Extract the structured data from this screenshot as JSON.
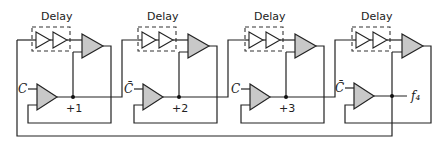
{
  "diagram": {
    "type": "circuit-schematic",
    "stages": [
      {
        "delay_label": "Delay",
        "control_label": "C",
        "output_label": "+1"
      },
      {
        "delay_label": "Delay",
        "control_label": "C̄",
        "output_label": "+2"
      },
      {
        "delay_label": "Delay",
        "control_label": "C",
        "output_label": "+3"
      },
      {
        "delay_label": "Delay",
        "control_label": "C̄",
        "output_label": "f₄"
      }
    ],
    "colors": {
      "line": "#222222",
      "amplifier_fill": "#c8c8c8",
      "background": "#ffffff"
    }
  }
}
